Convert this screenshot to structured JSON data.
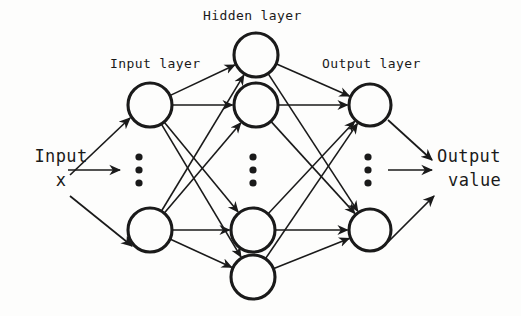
{
  "diagram": {
    "background_color": "#fdfdfc",
    "stroke_color": "#1a1a1a",
    "labels": {
      "input_layer": "Input layer",
      "hidden_layer": "Hidden layer",
      "output_layer": "Output layer",
      "input_text": "Input",
      "input_variable": "x",
      "output_text": "Output",
      "output_value": "value"
    },
    "layers": [
      {
        "id": "input",
        "name": "Input layer",
        "node_count_shown": 2,
        "has_ellipsis": true,
        "nodes": [
          {
            "id": "i1",
            "cx": 150,
            "cy": 105,
            "r": 22
          },
          {
            "id": "i2",
            "cx": 150,
            "cy": 230,
            "r": 22
          }
        ],
        "ellipsis": {
          "cx": 139,
          "cy": [
            157,
            170,
            183
          ],
          "r": 3.6
        }
      },
      {
        "id": "hidden",
        "name": "Hidden layer",
        "node_count_shown": 4,
        "has_ellipsis": true,
        "nodes": [
          {
            "id": "h1",
            "cx": 256,
            "cy": 55,
            "r": 22
          },
          {
            "id": "h2",
            "cx": 256,
            "cy": 105,
            "r": 22
          },
          {
            "id": "h3",
            "cx": 253,
            "cy": 230,
            "r": 22
          },
          {
            "id": "h4",
            "cx": 253,
            "cy": 277,
            "r": 22
          }
        ],
        "ellipsis": {
          "cx": 253,
          "cy": [
            157,
            170,
            183
          ],
          "r": 3.6
        }
      },
      {
        "id": "output",
        "name": "Output layer",
        "node_count_shown": 2,
        "has_ellipsis": true,
        "nodes": [
          {
            "id": "o1",
            "cx": 370,
            "cy": 105,
            "r": 21
          },
          {
            "id": "o2",
            "cx": 370,
            "cy": 230,
            "r": 21
          }
        ],
        "ellipsis": {
          "cx": 368,
          "cy": [
            157,
            170,
            183
          ],
          "r": 3.6
        }
      }
    ],
    "connections": {
      "input_to_hidden": [
        {
          "from": "i1",
          "to": "h1"
        },
        {
          "from": "i1",
          "to": "h2"
        },
        {
          "from": "i1",
          "to": "h3"
        },
        {
          "from": "i1",
          "to": "h4"
        },
        {
          "from": "i2",
          "to": "h1"
        },
        {
          "from": "i2",
          "to": "h2"
        },
        {
          "from": "i2",
          "to": "h3"
        },
        {
          "from": "i2",
          "to": "h4"
        }
      ],
      "hidden_to_output": [
        {
          "from": "h1",
          "to": "o1"
        },
        {
          "from": "h1",
          "to": "o2"
        },
        {
          "from": "h2",
          "to": "o1"
        },
        {
          "from": "h2",
          "to": "o2"
        },
        {
          "from": "h3",
          "to": "o1"
        },
        {
          "from": "h3",
          "to": "o2"
        },
        {
          "from": "h4",
          "to": "o1"
        },
        {
          "from": "h4",
          "to": "o2"
        }
      ],
      "fully_connected": true,
      "arrowheads": "at target node"
    },
    "external_arrows": {
      "inputs": [
        {
          "id": "in-arrow-upper",
          "x1": 70,
          "y1": 175,
          "x2": 130,
          "y2": 118
        },
        {
          "id": "in-arrow-middle",
          "x1": 68,
          "y1": 170,
          "x2": 120,
          "y2": 170
        },
        {
          "id": "in-arrow-lower",
          "x1": 70,
          "y1": 196,
          "x2": 132,
          "y2": 246
        }
      ],
      "outputs": [
        {
          "id": "out-arrow-upper",
          "x1": 388,
          "y1": 120,
          "x2": 432,
          "y2": 160
        },
        {
          "id": "out-arrow-middle",
          "x1": 388,
          "y1": 170,
          "x2": 432,
          "y2": 170
        },
        {
          "id": "out-arrow-lower",
          "x1": 388,
          "y1": 242,
          "x2": 434,
          "y2": 196
        }
      ]
    }
  }
}
